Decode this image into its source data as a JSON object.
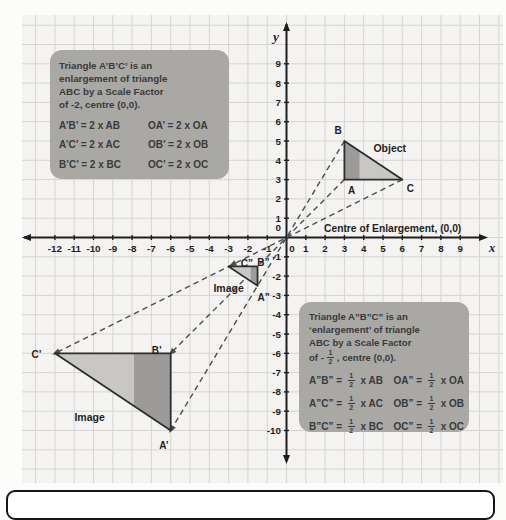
{
  "colors": {
    "grid_bg": "#f4f3f1",
    "grid_line": "#d5d4d1",
    "axis": "#1e1e1e",
    "dash": "#4d4d4d",
    "tri_light": "#c8c7c5",
    "tri_dark": "#9c9b99",
    "tri_outline": "#2e2e2e",
    "box_bg": "#a9a8a5",
    "box_text": "#3a3a3a",
    "label_text": "#1f1f1f"
  },
  "axes": {
    "x_letter": "x",
    "y_letter": "y",
    "centre_label": "Centre of Enlargement, (0,0)",
    "x_ticks": [
      -12,
      -11,
      -10,
      -9,
      -8,
      -7,
      -6,
      -5,
      -4,
      -3,
      -2,
      -1,
      0,
      1,
      2,
      3,
      4,
      5,
      6,
      7,
      8,
      9
    ],
    "y_ticks": [
      9,
      8,
      7,
      6,
      5,
      4,
      3,
      2,
      1,
      0,
      -1,
      -2,
      -3,
      -4,
      -5,
      -6,
      -7,
      -8,
      -9,
      -10
    ]
  },
  "triangles": [
    {
      "name": "object-triangle",
      "label": "Object",
      "label_pos": [
        5.35,
        4.62
      ],
      "pts": [
        [
          3,
          5
        ],
        [
          3,
          3
        ],
        [
          6,
          3
        ]
      ],
      "dark": [
        [
          3,
          5
        ],
        [
          3,
          3
        ],
        [
          3.78,
          3
        ],
        [
          3.78,
          4.48
        ]
      ],
      "vertices": [
        {
          "t": "B",
          "p": [
            2.68,
            5.52
          ]
        },
        {
          "t": "A",
          "p": [
            3.38,
            2.42
          ]
        },
        {
          "t": "C",
          "p": [
            6.42,
            2.52
          ]
        }
      ]
    },
    {
      "name": "image-triangle-large",
      "label": "Image",
      "label_pos": [
        -10.2,
        -9.32
      ],
      "pts": [
        [
          -12,
          -6
        ],
        [
          -6,
          -6
        ],
        [
          -6,
          -10
        ]
      ],
      "dark": [
        [
          -7.9,
          -6
        ],
        [
          -6,
          -6
        ],
        [
          -6,
          -10
        ],
        [
          -7.9,
          -8.73
        ]
      ],
      "vertices": [
        {
          "t": "C’",
          "p": [
            -12.95,
            -6.05
          ]
        },
        {
          "t": "B’",
          "p": [
            -6.72,
            -5.88
          ]
        },
        {
          "t": "A’",
          "p": [
            -6.35,
            -10.78
          ]
        }
      ]
    },
    {
      "name": "image-triangle-small",
      "label": "Image",
      "label_pos": [
        -3.0,
        -2.66
      ],
      "pts": [
        [
          -3,
          -1.5
        ],
        [
          -1.5,
          -1.5
        ],
        [
          -1.5,
          -2.5
        ]
      ],
      "dark": [
        [
          -1.85,
          -1.5
        ],
        [
          -1.5,
          -1.5
        ],
        [
          -1.5,
          -2.5
        ],
        [
          -1.85,
          -2.27
        ]
      ],
      "vertices": [
        {
          "t": "C”",
          "p": [
            -2.05,
            -1.33
          ]
        },
        {
          "t": "B”",
          "p": [
            -1.2,
            -1.28
          ]
        },
        {
          "t": "A”",
          "p": [
            -1.18,
            -3.12
          ]
        }
      ]
    }
  ],
  "rays": [
    {
      "from": [
        6,
        3
      ],
      "to": [
        -12,
        -6
      ],
      "extra_arrow": [
        -3,
        -1.5
      ]
    },
    {
      "from": [
        3,
        5
      ],
      "to": [
        -6,
        -10
      ]
    },
    {
      "from": [
        3,
        3
      ],
      "to": [
        -6,
        -6
      ]
    }
  ],
  "box1": {
    "lines": [
      "Triangle A’B’C’ is an",
      "enlargement of triangle",
      "ABC by a Scale Factor",
      "of -2, centre (0,0)."
    ],
    "equations": [
      {
        "c1": "A’B’ = 2 x AB",
        "c2": "OA’ = 2 x OA"
      },
      {
        "c1": "A’C’ = 2 x AC",
        "c2": "OB’ = 2 x OB"
      },
      {
        "c1": "B’C’ = 2 x BC",
        "c2": "OC’ = 2 x OC"
      }
    ]
  },
  "box2": {
    "lines": [
      "Triangle A”B”C” is an",
      "‘enlargement’ of triangle",
      "ABC by a Scale Factor"
    ],
    "line4": {
      "pre": "of -",
      "post": " , centre (0,0)."
    },
    "frac": {
      "n": "1",
      "d": "2"
    },
    "equations": [
      {
        "l1": "A”B” = ",
        "r1": " x AB",
        "l2": "OA” = ",
        "r2": " x OA"
      },
      {
        "l1": "A”C” = ",
        "r1": " x AC",
        "l2": "OB” = ",
        "r2": " x OB"
      },
      {
        "l1": "B”C” = ",
        "r1": " x BC",
        "l2": "OC” = ",
        "r2": " x OC"
      }
    ]
  }
}
